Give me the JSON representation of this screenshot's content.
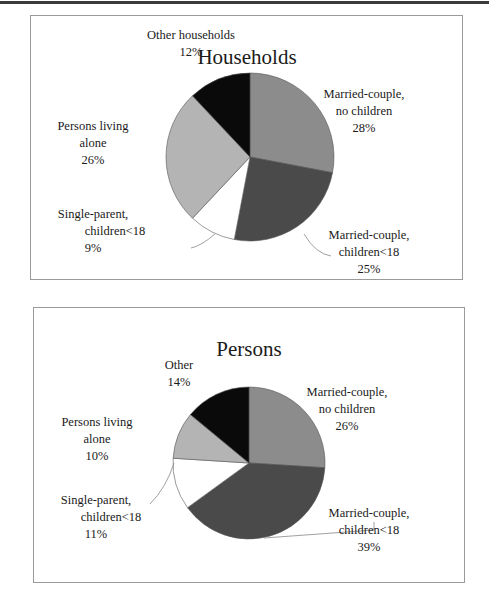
{
  "chart_data": [
    {
      "type": "pie",
      "title": "Households",
      "categories": [
        "Married-couple, no children",
        "Married-couple, children<18",
        "Single-parent, children<18",
        "Persons living alone",
        "Other households"
      ],
      "values": [
        28,
        25,
        9,
        26,
        12
      ],
      "unit": "%",
      "start_angle": "12 o'clock, clockwise",
      "colors": [
        "#8c8c8c",
        "#4a4a4a",
        "#ffffff",
        "#b4b4b4",
        "#0a0a0a"
      ],
      "labels": [
        {
          "lines": [
            "Married-couple,",
            "no children",
            "28%"
          ]
        },
        {
          "lines": [
            "Married-couple,",
            "children<18",
            "25%"
          ]
        },
        {
          "lines": [
            "Single-parent,",
            "children<18",
            "9%"
          ]
        },
        {
          "lines": [
            "Persons living",
            "alone",
            "26%"
          ]
        },
        {
          "lines": [
            "Other households",
            "12%"
          ]
        }
      ]
    },
    {
      "type": "pie",
      "title": "Persons",
      "categories": [
        "Married-couple, no children",
        "Married-couple, children<18",
        "Single-parent, children<18",
        "Persons living alone",
        "Other"
      ],
      "values": [
        26,
        39,
        11,
        10,
        14
      ],
      "unit": "%",
      "start_angle": "12 o'clock, clockwise",
      "colors": [
        "#8c8c8c",
        "#4a4a4a",
        "#ffffff",
        "#b4b4b4",
        "#0a0a0a"
      ],
      "labels": [
        {
          "lines": [
            "Married-couple,",
            "no children",
            "26%"
          ]
        },
        {
          "lines": [
            "Married-couple,",
            "children<18",
            "39%"
          ]
        },
        {
          "lines": [
            "Single-parent,",
            "children<18",
            "11%"
          ]
        },
        {
          "lines": [
            "Persons living",
            "alone",
            "10%"
          ]
        },
        {
          "lines": [
            "Other",
            "14%"
          ]
        }
      ]
    }
  ]
}
